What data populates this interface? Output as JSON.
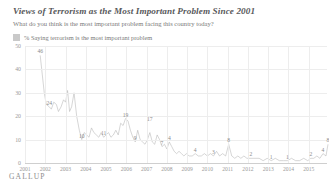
{
  "chart_data": {
    "type": "line",
    "title": "Views of Terrorism as the Most Important Problem Since 2001",
    "subtitle": "What do you think is the most important problem facing this country today?",
    "legend": [
      {
        "label": "% Saying terrorism is the most important problem",
        "color": "#c9c9c9"
      }
    ],
    "legend_position": "top-left",
    "xlabel": "",
    "ylabel": "",
    "ylim": [
      0,
      50
    ],
    "yticks": [
      50,
      40,
      30,
      20,
      10,
      0
    ],
    "xlim": [
      2001,
      2015.9
    ],
    "xticks": [
      "2001",
      "2002",
      "2003",
      "2004",
      "2005",
      "2006",
      "2007",
      "2008",
      "2009",
      "2010",
      "2011",
      "2012",
      "2013",
      "2014",
      "2015"
    ],
    "grid": true,
    "line_color": "#b3b3b3",
    "series": [
      {
        "name": "% Saying terrorism is the most important problem",
        "x": [
          2001.75,
          2001.85,
          2001.95,
          2002.05,
          2002.2,
          2002.3,
          2002.42,
          2002.55,
          2002.65,
          2002.78,
          2002.9,
          2003.0,
          2003.1,
          2003.2,
          2003.3,
          2003.42,
          2003.55,
          2003.68,
          2003.8,
          2003.92,
          2004.04,
          2004.16,
          2004.28,
          2004.4,
          2004.52,
          2004.64,
          2004.76,
          2004.88,
          2005.0,
          2005.12,
          2005.24,
          2005.36,
          2005.48,
          2005.6,
          2005.72,
          2005.84,
          2005.96,
          2006.08,
          2006.2,
          2006.32,
          2006.44,
          2006.56,
          2006.68,
          2006.8,
          2006.92,
          2007.04,
          2007.16,
          2007.28,
          2007.4,
          2007.52,
          2007.64,
          2007.76,
          2007.88,
          2008.0,
          2008.12,
          2008.24,
          2008.36,
          2008.48,
          2008.6,
          2008.72,
          2008.84,
          2008.96,
          2009.1,
          2009.25,
          2009.4,
          2009.55,
          2009.7,
          2009.85,
          2010.0,
          2010.15,
          2010.3,
          2010.45,
          2010.6,
          2010.75,
          2010.9,
          2011.05,
          2011.2,
          2011.35,
          2011.5,
          2011.65,
          2011.8,
          2011.95,
          2012.15,
          2012.35,
          2012.55,
          2012.75,
          2012.95,
          2013.15,
          2013.35,
          2013.55,
          2013.75,
          2013.95,
          2014.15,
          2014.35,
          2014.55,
          2014.75,
          2014.95,
          2015.1,
          2015.25,
          2015.4,
          2015.55,
          2015.7,
          2015.85,
          2015.95
        ],
        "values": [
          46,
          38,
          30,
          25,
          24,
          23,
          26,
          25,
          22,
          24,
          27,
          26,
          31,
          22,
          24,
          30,
          20,
          14,
          10,
          13,
          12,
          11,
          15,
          13,
          12,
          11,
          13,
          11,
          12,
          13,
          11,
          12,
          14,
          12,
          17,
          16,
          19,
          18,
          14,
          11,
          9,
          14,
          10,
          9,
          8,
          10,
          13,
          9,
          8,
          12,
          10,
          7,
          8,
          6,
          9,
          7,
          5,
          4,
          5,
          4,
          3,
          4,
          3,
          3,
          4,
          3,
          3,
          4,
          3,
          4,
          3,
          5,
          3,
          4,
          3,
          8,
          3,
          2,
          3,
          2,
          3,
          2,
          2,
          2,
          2,
          1,
          2,
          1,
          2,
          1,
          1,
          1,
          2,
          1,
          1,
          2,
          1,
          2,
          2,
          3,
          2,
          4,
          3,
          8
        ]
      }
    ],
    "annotations": [
      {
        "x": 2001.75,
        "y": 46,
        "text": "46"
      },
      {
        "x": 2002.2,
        "y": 24,
        "text": "24"
      },
      {
        "x": 2003.8,
        "y": 10,
        "text": "10"
      },
      {
        "x": 2004.88,
        "y": 11,
        "text": "11"
      },
      {
        "x": 2005.96,
        "y": 19,
        "text": "19"
      },
      {
        "x": 2007.16,
        "y": 17,
        "text": "17"
      },
      {
        "x": 2006.44,
        "y": 9,
        "text": "9"
      },
      {
        "x": 2008.12,
        "y": 9,
        "text": "4"
      },
      {
        "x": 2007.76,
        "y": 7,
        "text": "7"
      },
      {
        "x": 2009.4,
        "y": 4,
        "text": "4"
      },
      {
        "x": 2010.3,
        "y": 3,
        "text": "3"
      },
      {
        "x": 2011.05,
        "y": 8,
        "text": "8"
      },
      {
        "x": 2012.15,
        "y": 2,
        "text": "2"
      },
      {
        "x": 2013.15,
        "y": 1,
        "text": "1"
      },
      {
        "x": 2013.95,
        "y": 1,
        "text": "1"
      },
      {
        "x": 2015.1,
        "y": 2,
        "text": "2"
      },
      {
        "x": 2015.7,
        "y": 4,
        "text": "4"
      },
      {
        "x": 2015.95,
        "y": 8,
        "text": "8"
      }
    ]
  },
  "footer": {
    "brand": "GALLUP"
  }
}
